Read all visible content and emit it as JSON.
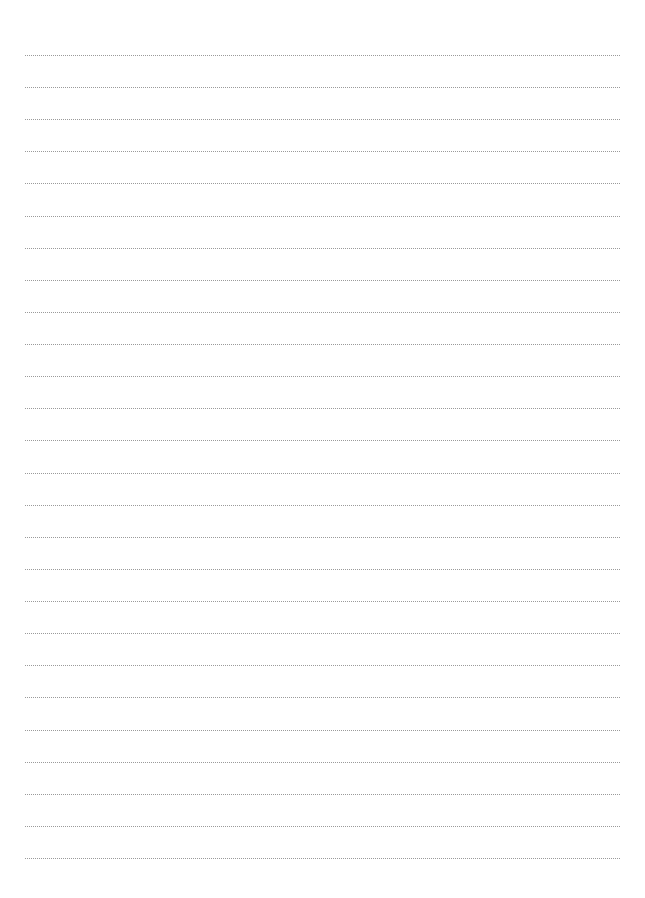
{
  "page": {
    "type": "lined-paper",
    "background_color": "#ffffff",
    "rule_color": "#9a9a9a",
    "rule_style": "dotted",
    "rule_count": 26,
    "rule_left_px": 25,
    "rule_right_px": 620,
    "first_rule_y_px": 55,
    "rule_spacing_px": 32.12
  }
}
